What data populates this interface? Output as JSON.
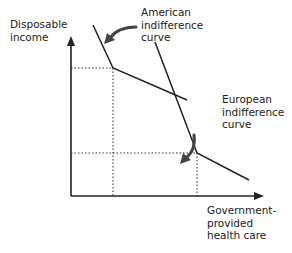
{
  "diagram": {
    "y_axis_label": "Disposable\nincome",
    "x_axis_label": "Government-\nprovided\nhealth care",
    "curves": [
      {
        "name": "American indifference curve",
        "label": "American\nindifference\ncurve",
        "points": [
          [
            93,
            25
          ],
          [
            113,
            68
          ],
          [
            187,
            100
          ]
        ]
      },
      {
        "name": "European indifference curve",
        "label": "European\nindifference\ncurve",
        "points": [
          [
            155,
            42
          ],
          [
            197,
            153
          ],
          [
            249,
            180
          ]
        ]
      }
    ],
    "guides": [
      {
        "from": [
          71,
          68
        ],
        "to": [
          113,
          68
        ]
      },
      {
        "from": [
          113,
          68
        ],
        "to": [
          113,
          196
        ]
      },
      {
        "from": [
          71,
          153
        ],
        "to": [
          197,
          153
        ]
      },
      {
        "from": [
          197,
          153
        ],
        "to": [
          197,
          196
        ]
      }
    ],
    "colors": {
      "line": "#222222",
      "text": "#222222",
      "arrow": "#444444"
    }
  }
}
